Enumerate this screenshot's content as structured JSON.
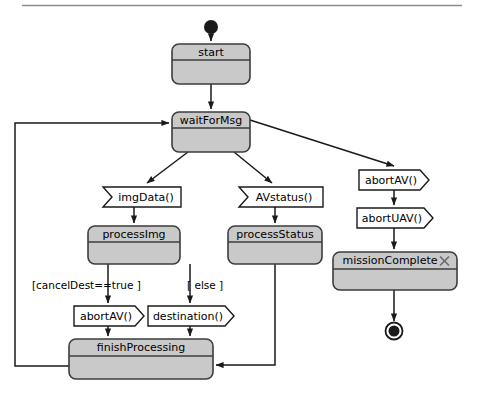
{
  "diagram": {
    "type": "uml-activity-diagram",
    "title_rule_visible": true,
    "colors": {
      "state_fill": "#c9c9c9",
      "state_border": "#3d3d3d",
      "signal_fill": "#ffffff",
      "signal_border": "#1a1a1a",
      "edge": "#1a1a1a",
      "rule": "#8c8c8c"
    },
    "initial_node": {
      "name": "initial-node"
    },
    "final_node": {
      "name": "final-node"
    },
    "states": [
      {
        "id": "start",
        "label": "start",
        "x": 172,
        "y": 44,
        "w": 78,
        "h": 40,
        "header_h": 16
      },
      {
        "id": "waitForMsg",
        "label": "waitForMsg",
        "x": 172,
        "y": 112,
        "w": 78,
        "h": 40,
        "header_h": 16
      },
      {
        "id": "processImg",
        "label": "processImg",
        "x": 88,
        "y": 226,
        "w": 92,
        "h": 38,
        "header_h": 16
      },
      {
        "id": "processStatus",
        "label": "processStatus",
        "x": 228,
        "y": 226,
        "w": 94,
        "h": 38,
        "header_h": 16
      },
      {
        "id": "missionComplete",
        "label": "missionComplete",
        "x": 333,
        "y": 252,
        "w": 124,
        "h": 38,
        "header_h": 17,
        "close_mark": "×"
      },
      {
        "id": "finishProcessing",
        "label": "finishProcessing",
        "x": 69,
        "y": 339,
        "w": 144,
        "h": 40,
        "header_h": 17
      }
    ],
    "signals": [
      {
        "id": "imgData",
        "label": "imgData()",
        "kind": "receive",
        "x": 103,
        "y": 187,
        "w": 78,
        "h": 20
      },
      {
        "id": "AVstatus",
        "label": "AVstatus()",
        "kind": "receive",
        "x": 239,
        "y": 187,
        "w": 84,
        "h": 20
      },
      {
        "id": "abortAV_right",
        "label": "abortAV()",
        "kind": "send",
        "x": 359,
        "y": 170,
        "w": 70,
        "h": 20
      },
      {
        "id": "abortUAV",
        "label": "abortUAV()",
        "kind": "send",
        "x": 357,
        "y": 208,
        "w": 76,
        "h": 20
      },
      {
        "id": "abortAV_left",
        "label": "abortAV()",
        "kind": "send",
        "x": 74,
        "y": 306,
        "w": 70,
        "h": 20
      },
      {
        "id": "destination",
        "label": "destination()",
        "kind": "send",
        "x": 148,
        "y": 306,
        "w": 86,
        "h": 20
      }
    ],
    "guards": [
      {
        "id": "guard-cancelDest",
        "label": "[cancelDest==true ]",
        "x": 32,
        "y": 286
      },
      {
        "id": "guard-else",
        "label": "[ else ]",
        "x": 187,
        "y": 286
      }
    ],
    "transitions": [
      {
        "from": "initial-node",
        "to": "start"
      },
      {
        "from": "start",
        "to": "waitForMsg"
      },
      {
        "from": "waitForMsg",
        "to": "imgData"
      },
      {
        "from": "waitForMsg",
        "to": "AVstatus"
      },
      {
        "from": "waitForMsg",
        "to": "abortAV_right"
      },
      {
        "from": "imgData",
        "to": "processImg"
      },
      {
        "from": "AVstatus",
        "to": "processStatus"
      },
      {
        "from": "abortAV_right",
        "to": "abortUAV"
      },
      {
        "from": "abortUAV",
        "to": "missionComplete"
      },
      {
        "from": "missionComplete",
        "to": "final-node"
      },
      {
        "from": "processImg",
        "to": "abortAV_left",
        "guard": "[cancelDest==true ]"
      },
      {
        "from": "processImg",
        "to": "destination",
        "guard": "[ else ]"
      },
      {
        "from": "abortAV_left",
        "to": "finishProcessing"
      },
      {
        "from": "destination",
        "to": "finishProcessing"
      },
      {
        "from": "processStatus",
        "to": "finishProcessing"
      },
      {
        "from": "finishProcessing",
        "to": "waitForMsg"
      }
    ]
  }
}
